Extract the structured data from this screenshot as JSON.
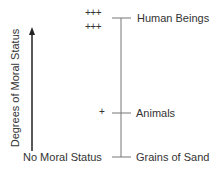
{
  "diagram": {
    "axis_label": "Degrees of Moral Status",
    "bottom_label": "No Moral Status",
    "levels": [
      {
        "name": "Human Beings",
        "marks": [
          "+++",
          "+++"
        ]
      },
      {
        "name": "Animals",
        "marks": [
          "+"
        ]
      },
      {
        "name": "Grains of Sand",
        "marks": []
      }
    ],
    "colors": {
      "line": "#555555",
      "arrow": "#222222",
      "text": "#333333"
    }
  }
}
